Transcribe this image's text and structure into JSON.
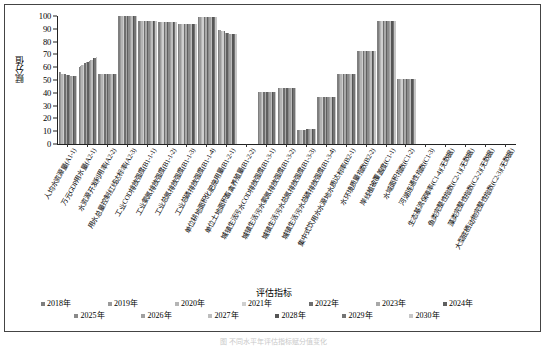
{
  "figure": {
    "caption": "图       不同水平年评估指标赋分值变化"
  },
  "axis": {
    "ylabel": "赋分值",
    "xlabel": "评估指标",
    "yticks": [
      0,
      10,
      20,
      30,
      40,
      50,
      60,
      70,
      80,
      90,
      100
    ],
    "ylim": [
      0,
      100
    ]
  },
  "legend": {
    "title": "评估指标",
    "items": [
      {
        "label": "2018年",
        "color": "#7f7f7f"
      },
      {
        "label": "2019年",
        "color": "#9a9a9a"
      },
      {
        "label": "2020年",
        "color": "#b5b5b5"
      },
      {
        "label": "2021年",
        "color": "#cfcfcf"
      },
      {
        "label": "2022年",
        "color": "#6e6e6e"
      },
      {
        "label": "2023年",
        "color": "#a8a8a8"
      },
      {
        "label": "2024年",
        "color": "#5f5f5f"
      },
      {
        "label": "2025年",
        "color": "#8a8a8a"
      },
      {
        "label": "2026年",
        "color": "#a0a0a0"
      },
      {
        "label": "2027年",
        "color": "#bdbdbd"
      },
      {
        "label": "2028年",
        "color": "#555555"
      },
      {
        "label": "2029年",
        "color": "#747474"
      },
      {
        "label": "2030年",
        "color": "#c6c6c6"
      }
    ]
  },
  "chart_data": {
    "type": "bar",
    "title": "",
    "xlabel": "评估指标",
    "ylabel": "赋分值",
    "ylim": [
      0,
      100
    ],
    "grid": false,
    "legend_position": "bottom",
    "series_names": [
      "2018年",
      "2019年",
      "2020年",
      "2021年",
      "2022年",
      "2023年",
      "2024年",
      "2025年",
      "2026年",
      "2027年",
      "2028年",
      "2029年",
      "2030年"
    ],
    "categories": [
      "人均水资源量(A1-1)",
      "万元GDP用水量(A2-1)",
      "水资源开发利用率(A2-2)",
      "用水总量控制红线达标率(A2-3)",
      "工业COD排放强度(B1-1-1)",
      "工业氨氮排放强度(B1-1-2)",
      "工业总氮排放强度(B1-1-3)",
      "工业总磷排放强度(B1-1-4)",
      "单位耕地面积化肥施用量(B1-2-1)",
      "单位土地面积畜禽养殖量(B1-2-2)",
      "城镇生活污水COD排放强度(B1-3-1)",
      "城镇生活污水氨氮排放强度(B1-3-2)",
      "城镇生活污水总氮排放强度(B1-3-3)",
      "城镇生活污水总磷排放强度(B1-3-4)",
      "集中式饮用水水源地水质达标率(B2-1)",
      "水环境质量指数(B2-2)",
      "岸线植被覆盖度(C1-1)",
      "水域面积指数(C1-2)",
      "河湖连通性指数(C1-3)",
      "生态基流保障率(C1-4)(无数据)",
      "鱼类完整性指数(C2-1)(无数据)",
      "藻类完整性指数(C2-2)(无数据)",
      "大型底栖动物完整性指数(C2-3)(无数据)"
    ],
    "values": [
      [
        56,
        56,
        55,
        55,
        55,
        54,
        54,
        54,
        53,
        53,
        53,
        53,
        53
      ],
      [
        60,
        61,
        62,
        62,
        63,
        64,
        64,
        65,
        66,
        66,
        67,
        67,
        68
      ],
      [
        55,
        55,
        55,
        55,
        55,
        55,
        55,
        55,
        55,
        55,
        55,
        55,
        55
      ],
      [
        100,
        100,
        100,
        100,
        100,
        100,
        100,
        100,
        100,
        100,
        100,
        100,
        100
      ],
      [
        96,
        96,
        96,
        96,
        96,
        96,
        96,
        96,
        96,
        96,
        96,
        96,
        96
      ],
      [
        95,
        95,
        95,
        95,
        95,
        95,
        95,
        95,
        95,
        95,
        95,
        95,
        95
      ],
      [
        94,
        94,
        94,
        94,
        94,
        94,
        94,
        94,
        94,
        94,
        94,
        94,
        94
      ],
      [
        99,
        99,
        99,
        99,
        99,
        99,
        99,
        99,
        99,
        99,
        99,
        99,
        99
      ],
      [
        89,
        89,
        88,
        88,
        88,
        87,
        87,
        87,
        86,
        86,
        86,
        86,
        86
      ],
      [
        0,
        0,
        0,
        0,
        0,
        0,
        0,
        0,
        0,
        0,
        0,
        0,
        0
      ],
      [
        41,
        41,
        41,
        41,
        41,
        41,
        41,
        41,
        41,
        41,
        41,
        41,
        41
      ],
      [
        44,
        44,
        44,
        44,
        44,
        44,
        44,
        44,
        44,
        44,
        44,
        44,
        44
      ],
      [
        11,
        11,
        11,
        11,
        11,
        11,
        12,
        12,
        12,
        12,
        12,
        12,
        12
      ],
      [
        37,
        37,
        37,
        37,
        37,
        37,
        37,
        37,
        37,
        37,
        37,
        37,
        37
      ],
      [
        55,
        55,
        55,
        55,
        55,
        55,
        55,
        55,
        55,
        55,
        55,
        55,
        55
      ],
      [
        73,
        73,
        73,
        73,
        73,
        73,
        73,
        73,
        73,
        73,
        73,
        73,
        73
      ],
      [
        96,
        96,
        96,
        96,
        96,
        96,
        96,
        96,
        96,
        96,
        96,
        96,
        96
      ],
      [
        51,
        51,
        51,
        51,
        51,
        51,
        51,
        51,
        51,
        51,
        51,
        51,
        51
      ],
      [
        0,
        0,
        0,
        0,
        0,
        0,
        0,
        0,
        0,
        0,
        0,
        0,
        0
      ],
      [
        0,
        0,
        0,
        0,
        0,
        0,
        0,
        0,
        0,
        0,
        0,
        0,
        0
      ],
      [
        0,
        0,
        0,
        0,
        0,
        0,
        0,
        0,
        0,
        0,
        0,
        0,
        0
      ],
      [
        0,
        0,
        0,
        0,
        0,
        0,
        0,
        0,
        0,
        0,
        0,
        0,
        0
      ],
      [
        0,
        0,
        0,
        0,
        0,
        0,
        0,
        0,
        0,
        0,
        0,
        0,
        0
      ]
    ]
  }
}
